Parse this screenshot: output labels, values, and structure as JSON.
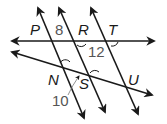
{
  "diagram": {
    "type": "parallel-lines-transversals",
    "colors": {
      "line": "#1a1a1a",
      "arc": "#1a1a1a",
      "point_label": "#1a1a1a",
      "angle_label": "#555555",
      "background": "#ffffff"
    },
    "point_labels": {
      "P": "P",
      "R": "R",
      "T": "T",
      "N": "N",
      "S": "S",
      "U": "U"
    },
    "angle_labels": {
      "a8": "8",
      "a12": "12",
      "a10": "10"
    }
  }
}
